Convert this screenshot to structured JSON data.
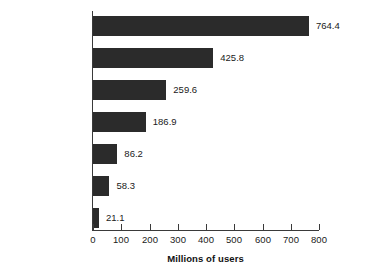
{
  "chart_data": {
    "type": "bar",
    "orientation": "horizontal",
    "title": "",
    "xlabel": "Millions of users",
    "ylabel": "",
    "xlim": [
      0,
      800
    ],
    "xticks": [
      0,
      100,
      200,
      300,
      400,
      500,
      600,
      700,
      800
    ],
    "xtick_labels": [
      "0",
      "100",
      "200",
      "300",
      "400",
      "500",
      "600",
      "700",
      "800"
    ],
    "grid": false,
    "legend": null,
    "bar_color": "#2b2b2b",
    "axis_color": "#3a3a3a",
    "background": "#ffffff",
    "categories": [
      "Asia",
      "Europe",
      "North America",
      "Latin America/\nCaribbean",
      "Africa",
      "Middle East",
      "Oceania/\nAustralia"
    ],
    "values": [
      764.4,
      425.8,
      259.6,
      186.9,
      86.2,
      58.3,
      21.1
    ],
    "value_labels": [
      "764.4",
      "425.8",
      "259.6",
      "186.9",
      "86.2",
      "58.3",
      "21.1"
    ]
  }
}
